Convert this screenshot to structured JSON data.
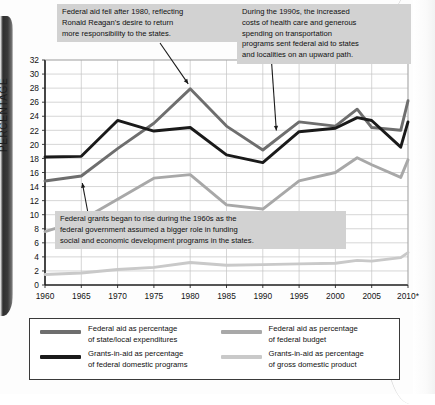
{
  "chart_data": {
    "type": "line",
    "title": "",
    "xlabel": "",
    "ylabel": "PERCENTAGE",
    "ylim": [
      0,
      32
    ],
    "ytick_step": 2,
    "yticks": [
      0,
      2,
      4,
      6,
      8,
      10,
      12,
      14,
      16,
      18,
      20,
      22,
      24,
      26,
      28,
      30,
      32
    ],
    "x": [
      1960,
      1965,
      1970,
      1975,
      1980,
      1985,
      1990,
      1995,
      2000,
      2005,
      2010
    ],
    "xticklabels": [
      "1960",
      "1965",
      "1970",
      "1975",
      "1980",
      "1985",
      "1990",
      "1995",
      "2000",
      "2005",
      "2010*"
    ],
    "grid": true,
    "legend_position": "bottom",
    "series": [
      {
        "name": "Federal aid as percentage of state/local expenditures",
        "color": "#6e6e6e",
        "x": [
          1960,
          1965,
          1970,
          1975,
          1980,
          1985,
          1990,
          1995,
          2000,
          2003,
          2005,
          2009,
          2010
        ],
        "values": [
          14.8,
          15.5,
          19.4,
          23.0,
          27.9,
          22.6,
          19.2,
          23.2,
          22.6,
          25.0,
          22.4,
          22.0,
          26.2
        ]
      },
      {
        "name": "Grants-in-aid as percentage of federal domestic programs",
        "color": "#1a1a1a",
        "x": [
          1960,
          1965,
          1970,
          1975,
          1980,
          1985,
          1990,
          1995,
          2000,
          2003,
          2005,
          2009,
          2010
        ],
        "values": [
          18.2,
          18.3,
          23.4,
          21.9,
          22.4,
          18.5,
          17.4,
          21.8,
          22.3,
          23.8,
          23.4,
          19.6,
          23.2
        ]
      },
      {
        "name": "Federal aid as percentage of federal budget",
        "color": "#a8a8a8",
        "x": [
          1960,
          1965,
          1970,
          1975,
          1980,
          1985,
          1990,
          1995,
          2000,
          2003,
          2005,
          2009,
          2010
        ],
        "values": [
          7.6,
          9.2,
          12.2,
          15.2,
          15.7,
          11.4,
          10.8,
          14.8,
          16.0,
          18.1,
          17.1,
          15.3,
          17.8
        ]
      },
      {
        "name": "Grants-in-aid as percentage of gross domestic product",
        "color": "#c9c9c9",
        "x": [
          1960,
          1965,
          1970,
          1975,
          1980,
          1985,
          1990,
          1995,
          2000,
          2003,
          2005,
          2009,
          2010
        ],
        "values": [
          1.5,
          1.7,
          2.2,
          2.5,
          3.2,
          2.8,
          2.9,
          3.0,
          3.1,
          3.5,
          3.4,
          3.9,
          4.6
        ]
      }
    ],
    "annotations": [
      {
        "id": "reagan",
        "text": "Federal aid fell after 1980, reflecting\nRonald Reagan's desire to return\nmore responsibility to the states.",
        "target_x": 1980,
        "target_y": 27.9
      },
      {
        "id": "nineties",
        "text": "During the 1990s, the increased\ncosts of health care and generous\nspending on transportation\nprograms sent federal aid to states\nand localities on an upward path.",
        "target_x": 1992,
        "target_y": 21.4
      },
      {
        "id": "sixties",
        "text": "Federal grants began to rise during the 1960s as the\nfederal  government assumed a bigger role in funding\nsocial and economic development programs in the states.",
        "target_x": 1965,
        "target_y": 15.5
      }
    ]
  },
  "legend": {
    "items": [
      {
        "label": "Federal aid as percentage\nof state/local expenditures",
        "color": "#6e6e6e"
      },
      {
        "label": "Federal aid as percentage\nof federal budget",
        "color": "#a8a8a8"
      },
      {
        "label": "Grants-in-aid as percentage\nof federal domestic programs",
        "color": "#1a1a1a"
      },
      {
        "label": "Grants-in-aid as percentage\nof gross domestic product",
        "color": "#c9c9c9"
      }
    ]
  }
}
